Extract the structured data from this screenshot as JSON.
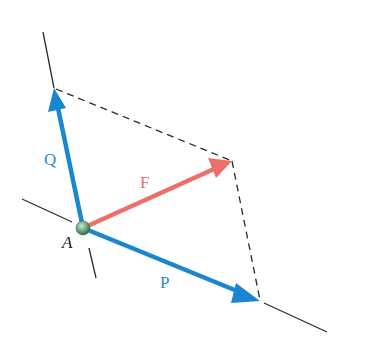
{
  "diagram": {
    "colors": {
      "vector_component": "#1a86d0",
      "vector_resultant": "#ee6f6a",
      "line": "#2b2b2b",
      "point": "#5e9a72"
    },
    "point": {
      "label": "A",
      "x": 83,
      "y": 228
    },
    "vectors": [
      {
        "name": "Q",
        "label": "Q",
        "from": [
          83,
          228
        ],
        "to": [
          54,
          88
        ],
        "color": "#1a86d0",
        "label_pos": [
          52,
          164
        ]
      },
      {
        "name": "P",
        "label": "P",
        "from": [
          83,
          228
        ],
        "to": [
          260,
          301
        ],
        "color": "#1a86d0",
        "label_pos": [
          166,
          287
        ]
      },
      {
        "name": "F",
        "label": "F",
        "from": [
          83,
          228
        ],
        "to": [
          232,
          161
        ],
        "color": "#ee6f6a",
        "label_pos": [
          146,
          187
        ]
      }
    ],
    "lines_of_action": [
      {
        "name": "q-line-upper",
        "from": [
          43,
          32
        ],
        "to": [
          54,
          88
        ]
      },
      {
        "name": "q-line-lower",
        "from": [
          89,
          248
        ],
        "to": [
          96,
          278
        ]
      },
      {
        "name": "p-line-left",
        "from": [
          22,
          199
        ],
        "to": [
          72,
          222
        ]
      },
      {
        "name": "p-line-right",
        "from": [
          264,
          303
        ],
        "to": [
          327,
          332
        ]
      }
    ],
    "dashed_lines": [
      {
        "name": "dashed-q-to-f",
        "from": [
          54,
          88
        ],
        "to": [
          232,
          161
        ]
      },
      {
        "name": "dashed-f-to-p",
        "from": [
          232,
          161
        ],
        "to": [
          260,
          301
        ]
      }
    ]
  }
}
